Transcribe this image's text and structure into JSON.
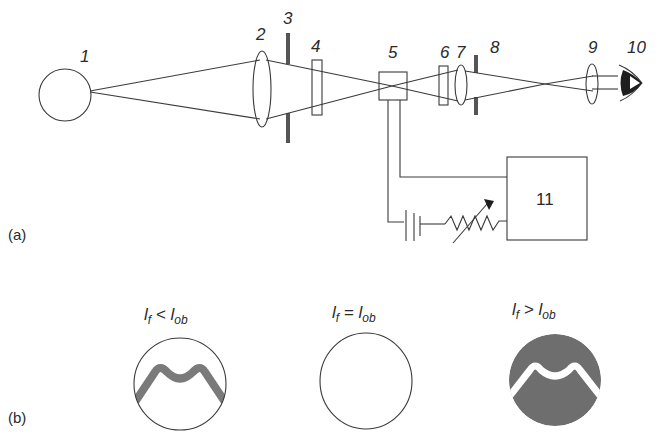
{
  "panel_a": {
    "label": "(a)",
    "components": [
      {
        "id": "1",
        "label": "1",
        "kind": "light-source"
      },
      {
        "id": "2",
        "label": "2",
        "kind": "condenser-lens"
      },
      {
        "id": "3",
        "label": "3",
        "kind": "diaphragm"
      },
      {
        "id": "4",
        "label": "4",
        "kind": "filter"
      },
      {
        "id": "5",
        "label": "5",
        "kind": "filament-lamp"
      },
      {
        "id": "6",
        "label": "6",
        "kind": "filter"
      },
      {
        "id": "7",
        "label": "7",
        "kind": "objective-lens"
      },
      {
        "id": "8",
        "label": "8",
        "kind": "diaphragm"
      },
      {
        "id": "9",
        "label": "9",
        "kind": "eyepiece-lens"
      },
      {
        "id": "10",
        "label": "10",
        "kind": "eye"
      },
      {
        "id": "11",
        "label": "11",
        "kind": "measuring-device"
      }
    ],
    "box_label": "11"
  },
  "panel_b": {
    "label": "(b)",
    "cases": [
      {
        "id": "less",
        "l_main": "l",
        "sub1": "f",
        "relation": " < ",
        "l2": "l",
        "sub2": "ob",
        "appearance": "dark filament on bright field"
      },
      {
        "id": "equal",
        "l_main": "l",
        "sub1": "f",
        "relation": " = ",
        "l2": "l",
        "sub2": "ob",
        "appearance": "filament disappears"
      },
      {
        "id": "greater",
        "l_main": "l",
        "sub1": "f",
        "relation": " > ",
        "l2": "l",
        "sub2": "ob",
        "appearance": "bright filament on dark field"
      }
    ]
  },
  "colors": {
    "line": "#3a3a3a",
    "gray_fill": "#6e6e6e",
    "diaphragm": "#777777",
    "background": "#ffffff"
  }
}
